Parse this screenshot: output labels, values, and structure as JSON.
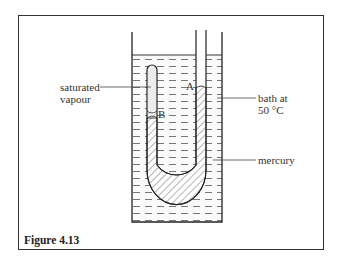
{
  "figure": {
    "caption": "Figure 4.13",
    "labels": {
      "saturated_vapour_line1": "saturated",
      "saturated_vapour_line2": "vapour",
      "point_a": "A",
      "point_b": "B",
      "bath_line1": "bath at",
      "bath_line2": "50 °C",
      "mercury": "mercury"
    }
  }
}
